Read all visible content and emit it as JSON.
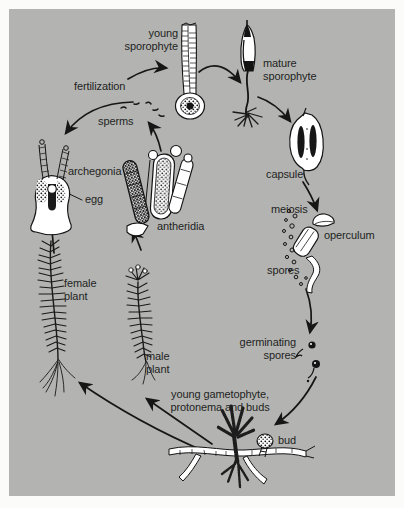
{
  "figure": {
    "colors": {
      "background": "#b3b4b1",
      "frame": "#fbfbfa",
      "ink": "#1f1f1f",
      "drawing_fill": "#ffffff"
    },
    "labels": {
      "young_sporophyte": "young\nsporophyte",
      "mature_sporophyte": "mature\nsporophyte",
      "fertilization": "fertilization",
      "sperms": "sperms",
      "archegonia": "archegonia",
      "egg": "egg",
      "antheridia": "antheridia",
      "capsule": "capsule",
      "meiosis": "meiosis",
      "operculum": "operculum",
      "spores": "spores",
      "germinating_spores": "germinating\nspores",
      "female_plant": "female\nplant",
      "male_plant": "male\nplant",
      "young_gametophyte": "young gametophyte,\nprotonema and buds",
      "bud": "bud"
    },
    "arrows": [
      {
        "from": "fertilization",
        "to": "young sporophyte"
      },
      {
        "from": "young sporophyte",
        "to": "mature sporophyte"
      },
      {
        "from": "mature sporophyte",
        "to": "capsule"
      },
      {
        "from": "capsule",
        "to": "operculum",
        "via": "meiosis"
      },
      {
        "from": "spores",
        "to": "germinating spores"
      },
      {
        "from": "germinating spores",
        "to": "bud / protonema"
      },
      {
        "from": "protonema",
        "to": "male plant"
      },
      {
        "from": "protonema",
        "to": "female plant"
      },
      {
        "from": "female plant",
        "to": "archegonia"
      },
      {
        "from": "male plant",
        "to": "antheridia"
      },
      {
        "from": "antheridia",
        "to": "sperms"
      },
      {
        "from": "sperms",
        "to": "archegonia (fertilization)"
      }
    ]
  }
}
